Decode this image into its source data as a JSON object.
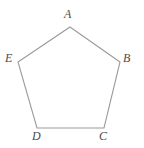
{
  "figure": {
    "kind": "polygon-diagram",
    "shape_name": "pentagon",
    "background_color": "#ffffff",
    "stroke_color": "#9a9a9a",
    "stroke_width": 1.1,
    "fill": "none",
    "label_color": "#4a4a4a",
    "label_style": "italic-serif",
    "canvas": {
      "width": 144,
      "height": 148
    },
    "vertices": [
      {
        "id": "A",
        "label": "A",
        "x": 70,
        "y": 27,
        "label_x": 64,
        "label_y": 8
      },
      {
        "id": "B",
        "label": "B",
        "x": 120,
        "y": 62,
        "label_x": 123,
        "label_y": 52
      },
      {
        "id": "C",
        "label": "C",
        "x": 104,
        "y": 128,
        "label_x": 99,
        "label_y": 130
      },
      {
        "id": "D",
        "label": "D",
        "x": 37,
        "y": 128,
        "label_x": 32,
        "label_y": 130
      },
      {
        "id": "E",
        "label": "E",
        "x": 18,
        "y": 62,
        "label_x": 5,
        "label_y": 52
      }
    ],
    "edges": [
      {
        "from": "A",
        "to": "B"
      },
      {
        "from": "B",
        "to": "C"
      },
      {
        "from": "C",
        "to": "D"
      },
      {
        "from": "D",
        "to": "E"
      },
      {
        "from": "E",
        "to": "A"
      }
    ],
    "path_points": "70,27 120,62 104,128 37,128 18,62"
  }
}
